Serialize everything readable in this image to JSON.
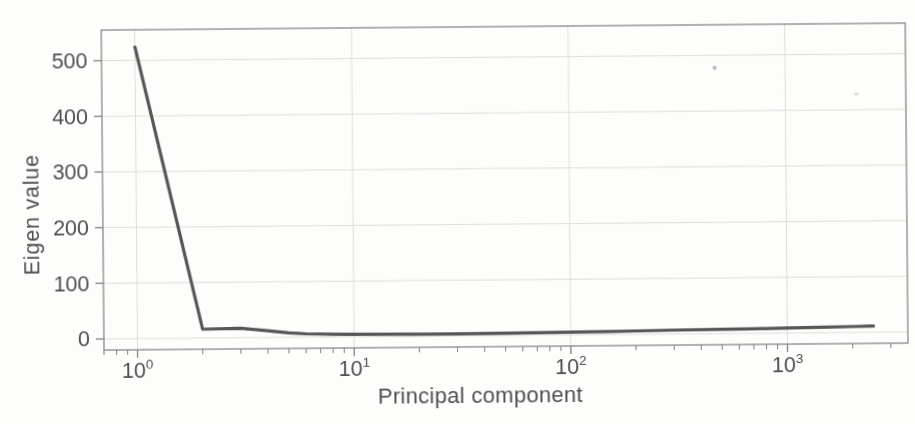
{
  "figure": {
    "background_color": "#fdfdfc",
    "frame_color": "#919191",
    "grid_color": "#dededa",
    "axis_tick_color": "#8a8a8a",
    "text_color": "#4e4e4e",
    "line_color": "#565656",
    "scan_speck_color": "#b5b5b5"
  },
  "chart_data": {
    "type": "line",
    "title": "",
    "xlabel": "Principal component",
    "ylabel": "Eigen value",
    "x_scale": "log",
    "y_scale": "linear",
    "xlim": [
      0.7,
      3600
    ],
    "ylim": [
      -20,
      555
    ],
    "grid": true,
    "legend": false,
    "x_minor_ticks": true,
    "y_ticks": [
      {
        "label": "0",
        "value": 0
      },
      {
        "label": "100",
        "value": 100
      },
      {
        "label": "200",
        "value": 200
      },
      {
        "label": "300",
        "value": 300
      },
      {
        "label": "400",
        "value": 400
      },
      {
        "label": "500",
        "value": 500
      }
    ],
    "x_ticks": [
      {
        "base": "10",
        "exponent": "0",
        "value": 1
      },
      {
        "base": "10",
        "exponent": "1",
        "value": 10
      },
      {
        "base": "10",
        "exponent": "2",
        "value": 100
      },
      {
        "base": "10",
        "exponent": "3",
        "value": 1000
      }
    ],
    "series": [
      {
        "name": "eigenvalues",
        "x": [
          1,
          2,
          3,
          4,
          5,
          6,
          8,
          10,
          15,
          20,
          30,
          50,
          70,
          100,
          150,
          200,
          300,
          500,
          700,
          1000,
          1500,
          2000,
          2500
        ],
        "y": [
          524,
          16,
          17,
          12,
          8,
          6,
          5,
          4.5,
          4,
          3.5,
          3.5,
          4,
          4.5,
          5,
          5.5,
          6,
          7,
          7.5,
          8,
          9,
          10,
          10.5,
          11
        ]
      }
    ]
  }
}
